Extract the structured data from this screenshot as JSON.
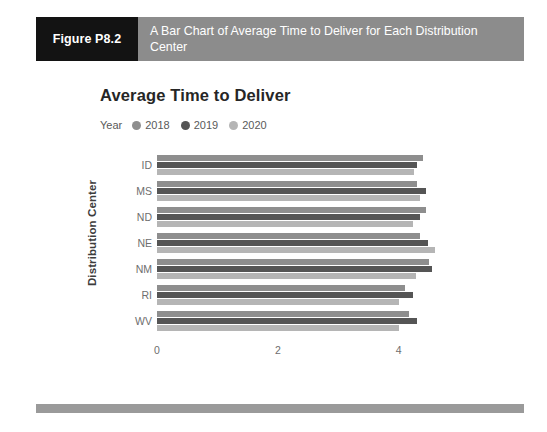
{
  "figure": {
    "tag": "Figure P8.2",
    "caption": "A Bar Chart of Average Time to Deliver for Each Distribution Center"
  },
  "chart": {
    "title": "Average Time to Deliver",
    "legend_label": "Year"
  },
  "colors": {
    "caption_bar": "#8c8c8c",
    "caption_tag": "#131313",
    "footer_bar": "#9a9a9a",
    "series_2018": "#8e8e8e",
    "series_2019": "#555555",
    "series_2020": "#b5b5b5",
    "panel_background": "#ffffff",
    "page_background": "#ffffff"
  },
  "chart_data": {
    "type": "bar",
    "orientation": "horizontal",
    "title": "Average Time to Deliver",
    "xlabel": "",
    "ylabel": "Distribution Center",
    "categories": [
      "ID",
      "MS",
      "ND",
      "NE",
      "NM",
      "RI",
      "WV"
    ],
    "xlim": [
      0,
      4.8
    ],
    "xticks": [
      0,
      2,
      4
    ],
    "xtick_labels": [
      "0",
      "2",
      "4"
    ],
    "grid": false,
    "legend_position": "top-left",
    "legend_title": "Year",
    "series": [
      {
        "name": "2018",
        "color": "#8e8e8e",
        "values": [
          4.4,
          4.3,
          4.45,
          4.35,
          4.5,
          4.1,
          4.17
        ]
      },
      {
        "name": "2019",
        "color": "#555555",
        "values": [
          4.3,
          4.45,
          4.35,
          4.48,
          4.55,
          4.23,
          4.3
        ]
      },
      {
        "name": "2020",
        "color": "#b5b5b5",
        "values": [
          4.25,
          4.35,
          4.23,
          4.6,
          4.28,
          4.0,
          4.0
        ]
      }
    ]
  }
}
